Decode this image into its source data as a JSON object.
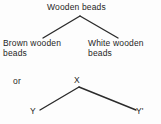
{
  "diagram": {
    "title_text": "Wooden beads",
    "background_color": "#fdfdfd",
    "line_color": "#2b2b2b",
    "text_color": "#1f1f1f",
    "connector_label": "or",
    "tree_concrete": {
      "root": "Wooden beads",
      "children": [
        "Brown wooden\nbeads",
        "White wooden\nbeads"
      ]
    },
    "tree_abstract": {
      "root": "X",
      "children": [
        "Y",
        "Y'"
      ]
    }
  }
}
